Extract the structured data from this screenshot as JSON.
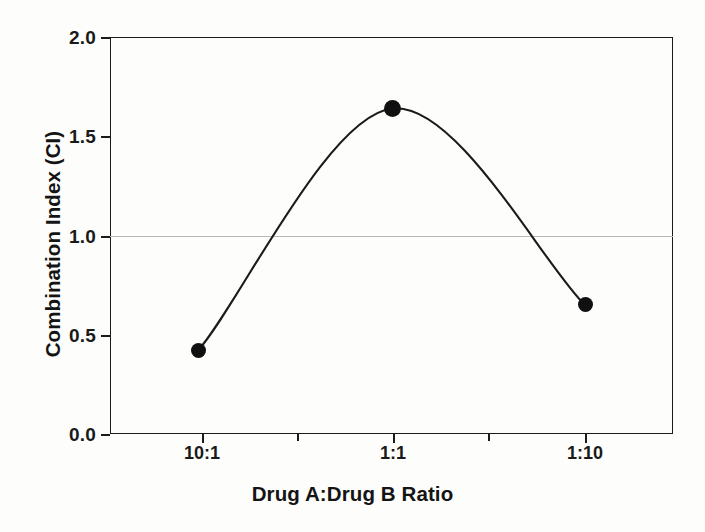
{
  "chart_data": {
    "type": "line",
    "title": "",
    "subtitle": "",
    "xlabel": "Drug A:Drug B Ratio",
    "ylabel": "Combination Index (CI)",
    "categories": [
      "10:1",
      "1:1",
      "1:10"
    ],
    "values": [
      0.42,
      1.64,
      0.65
    ],
    "series": [
      {
        "name": "Combination Index",
        "values": [
          0.42,
          1.64,
          0.65
        ],
        "marker": "filled-circle",
        "color": "#101010"
      }
    ],
    "ylim": [
      0.0,
      2.0
    ],
    "y_ticks": [
      "0.0",
      "0.5",
      "1.0",
      "1.5",
      "2.0"
    ],
    "y_tick_values": [
      0.0,
      0.5,
      1.0,
      1.5,
      2.0
    ],
    "x_ticks": [
      "10:1",
      "1:1",
      "1:10"
    ],
    "x_minor_tick_count": 2,
    "grid": false,
    "legend": null,
    "legend_position": "none",
    "reference_line": {
      "value": 1.0,
      "orientation": "horizontal",
      "color": "#b9b9b9",
      "label": ""
    },
    "annotations": [],
    "line_style": "smooth-spline",
    "line_color": "#1b1b1b",
    "frame_color": "#1b1b1b",
    "background": "#fdfdfc"
  },
  "axes": {
    "y_title": "Combination Index (CI)",
    "x_title": "Drug A:Drug B Ratio",
    "y_labels": [
      "2.0",
      "1.5",
      "1.0",
      "0.5",
      "0.0"
    ],
    "x_labels": [
      "10:1",
      "1:1",
      "1:10"
    ]
  }
}
